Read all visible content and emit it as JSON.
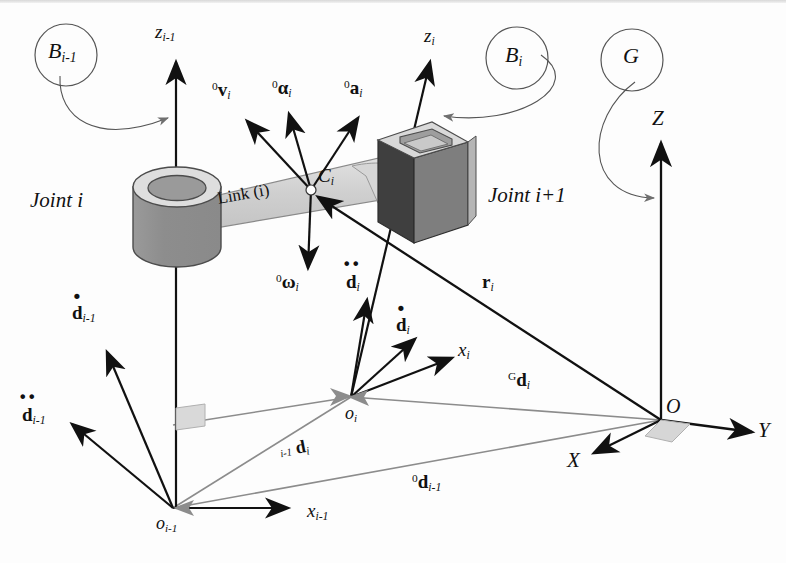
{
  "figure": {
    "background_color": "#fdfdfd",
    "ink_color": "#111111",
    "gray_vector_color": "#8c8c8c",
    "body_fill_dark": "#8a8a8a",
    "body_fill_mid": "#b9b9b9",
    "body_fill_light": "#dcdcdc",
    "link_fill": "#d4d4d4"
  },
  "frames": {
    "body_prev": {
      "label": "B",
      "sub": "i-1",
      "caption": "B i-1 frame callout"
    },
    "body_cur": {
      "label": "B",
      "sub": "i",
      "caption": "B i frame callout"
    },
    "global": {
      "label": "G",
      "sub": "",
      "caption": "G global frame callout"
    }
  },
  "bodies": {
    "joint_i": {
      "label": "Joint i",
      "type": "cylinder"
    },
    "joint_i_plus_1": {
      "label": "Joint i+1",
      "type": "box"
    },
    "link": {
      "label": "Link (i)"
    }
  },
  "points": {
    "center_of_mass": {
      "label": "C",
      "sub": "i"
    },
    "origin_i": {
      "label": "o",
      "sub": "i"
    },
    "origin_i_prev": {
      "label": "o",
      "sub": "i-1"
    },
    "global_origin": {
      "label": "O",
      "sub": ""
    }
  },
  "axes": {
    "z_prev": {
      "label": "z",
      "sub": "i-1"
    },
    "z_cur": {
      "label": "z",
      "sub": "i"
    },
    "x_prev": {
      "label": "x",
      "sub": "i-1"
    },
    "x_cur": {
      "label": "x",
      "sub": "i"
    },
    "global_X": {
      "label": "X"
    },
    "global_Y": {
      "label": "Y"
    },
    "global_Z": {
      "label": "Z"
    }
  },
  "vectors": [
    {
      "name": "velocity-of-link",
      "pre": "0",
      "sym": "v",
      "sub": "i",
      "dots": 0,
      "bold": true,
      "desc": "0 v i"
    },
    {
      "name": "angular-acceleration",
      "pre": "0",
      "sym": "α",
      "sub": "i",
      "dots": 0,
      "bold": true,
      "desc": "0 alpha i"
    },
    {
      "name": "acceleration-of-link",
      "pre": "0",
      "sym": "a",
      "sub": "i",
      "dots": 0,
      "bold": true,
      "desc": "0 a i"
    },
    {
      "name": "angular-velocity",
      "pre": "0",
      "sym": "ω",
      "sub": "i",
      "dots": 0,
      "bold": true,
      "desc": "0 omega i"
    },
    {
      "name": "d-prev-first-derivative",
      "pre": "",
      "sym": "d",
      "sub": "i-1",
      "dots": 1,
      "bold": true,
      "desc": "d dot i-1"
    },
    {
      "name": "d-prev-second-derivative",
      "pre": "",
      "sym": "d",
      "sub": "i-1",
      "dots": 2,
      "bold": true,
      "desc": "d ddot i-1"
    },
    {
      "name": "d-cur-first-derivative",
      "pre": "",
      "sym": "d",
      "sub": "i",
      "dots": 1,
      "bold": true,
      "desc": "d dot i"
    },
    {
      "name": "d-cur-second-derivative",
      "pre": "",
      "sym": "d",
      "sub": "i",
      "dots": 2,
      "bold": true,
      "desc": "d ddot i"
    },
    {
      "name": "position-r",
      "pre": "",
      "sym": "r",
      "sub": "i",
      "dots": 0,
      "bold": true,
      "desc": "r i"
    },
    {
      "name": "relative-position-d",
      "pre": "i-1",
      "sym": "d",
      "sub": "i",
      "dots": 0,
      "bold": true,
      "desc": "i-1 d i"
    },
    {
      "name": "global-position-d",
      "pre": "G",
      "sym": "d",
      "sub": "i",
      "dots": 0,
      "bold": true,
      "desc": "G d i"
    },
    {
      "name": "zero-position-d-prev",
      "pre": "0",
      "sym": "d",
      "sub": "i-1",
      "dots": 0,
      "bold": true,
      "desc": "0 d i-1"
    }
  ]
}
